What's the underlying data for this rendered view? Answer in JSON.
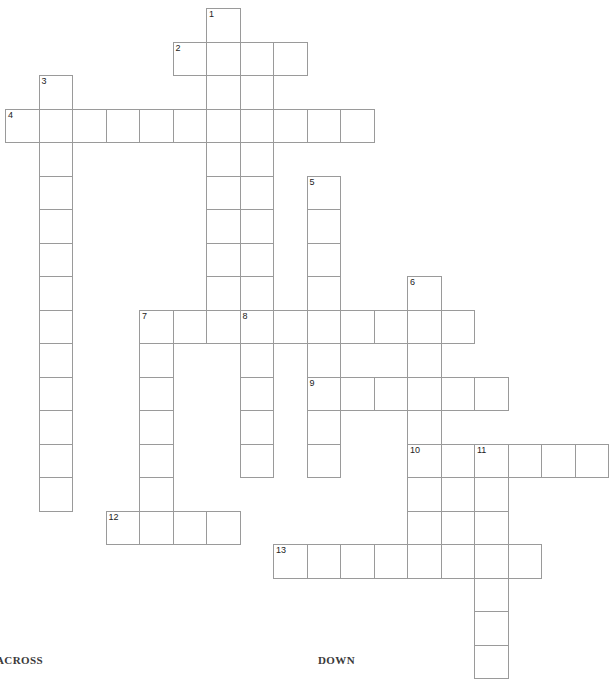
{
  "page": {
    "background_color": "#ffffff",
    "width": 607,
    "height": 666
  },
  "grid": {
    "cell_size": 33.5,
    "origin_x": 5,
    "origin_y": 8,
    "line_color": "#9a9a9a",
    "cell_fill": "#ffffff",
    "number_color": "#222222",
    "number_font_size": 9,
    "columns": 18,
    "rows": 20
  },
  "headings": {
    "across_label": "ACROSS",
    "down_label": "DOWN"
  },
  "entries": [
    {
      "number": "1",
      "direction": "down",
      "col": 6,
      "row": 0,
      "length": 12
    },
    {
      "number": "2",
      "direction": "across",
      "col": 5,
      "row": 1,
      "length": 4
    },
    {
      "number": "3",
      "direction": "down",
      "col": 1,
      "row": 2,
      "length": 13
    },
    {
      "number": "4",
      "direction": "across",
      "col": 0,
      "row": 3,
      "length": 11
    },
    {
      "number": "5",
      "direction": "down",
      "col": 9,
      "row": 5,
      "length": 10
    },
    {
      "number": "6",
      "direction": "down",
      "col": 12,
      "row": 8,
      "length": 8
    },
    {
      "number": "7",
      "direction": "across",
      "col": 4,
      "row": 9,
      "length": 10
    },
    {
      "number": "7",
      "direction": "down",
      "col": 4,
      "row": 9,
      "length": 7
    },
    {
      "number": "8",
      "direction": "down",
      "col": 7,
      "row": 9,
      "length": 6
    },
    {
      "number": "9",
      "direction": "across",
      "col": 9,
      "row": 11,
      "length": 6
    },
    {
      "number": "10",
      "direction": "across",
      "col": 12,
      "row": 13,
      "length": 6
    },
    {
      "number": "11",
      "direction": "down",
      "col": 14,
      "row": 13,
      "length": 7
    },
    {
      "number": "12",
      "direction": "across",
      "col": 3,
      "row": 15,
      "length": 4
    },
    {
      "number": "13",
      "direction": "across",
      "col": 8,
      "row": 16,
      "length": 8
    }
  ],
  "cells": [
    {
      "col": 6,
      "row": 0,
      "number": "1"
    },
    {
      "col": 5,
      "row": 1,
      "number": "2"
    },
    {
      "col": 6,
      "row": 1,
      "number": ""
    },
    {
      "col": 7,
      "row": 1,
      "number": ""
    },
    {
      "col": 8,
      "row": 1,
      "number": ""
    },
    {
      "col": 6,
      "row": 2,
      "number": ""
    },
    {
      "col": 7,
      "row": 2,
      "number": ""
    },
    {
      "col": 1,
      "row": 2,
      "number": "3"
    },
    {
      "col": 0,
      "row": 3,
      "number": "4"
    },
    {
      "col": 1,
      "row": 3,
      "number": ""
    },
    {
      "col": 2,
      "row": 3,
      "number": ""
    },
    {
      "col": 3,
      "row": 3,
      "number": ""
    },
    {
      "col": 4,
      "row": 3,
      "number": ""
    },
    {
      "col": 5,
      "row": 3,
      "number": ""
    },
    {
      "col": 6,
      "row": 3,
      "number": ""
    },
    {
      "col": 7,
      "row": 3,
      "number": ""
    },
    {
      "col": 8,
      "row": 3,
      "number": ""
    },
    {
      "col": 9,
      "row": 3,
      "number": ""
    },
    {
      "col": 10,
      "row": 3,
      "number": ""
    },
    {
      "col": 1,
      "row": 4,
      "number": ""
    },
    {
      "col": 6,
      "row": 4,
      "number": ""
    },
    {
      "col": 7,
      "row": 4,
      "number": ""
    },
    {
      "col": 1,
      "row": 5,
      "number": ""
    },
    {
      "col": 6,
      "row": 5,
      "number": ""
    },
    {
      "col": 7,
      "row": 5,
      "number": ""
    },
    {
      "col": 9,
      "row": 5,
      "number": "5"
    },
    {
      "col": 1,
      "row": 6,
      "number": ""
    },
    {
      "col": 6,
      "row": 6,
      "number": ""
    },
    {
      "col": 7,
      "row": 6,
      "number": ""
    },
    {
      "col": 9,
      "row": 6,
      "number": ""
    },
    {
      "col": 1,
      "row": 7,
      "number": ""
    },
    {
      "col": 6,
      "row": 7,
      "number": ""
    },
    {
      "col": 7,
      "row": 7,
      "number": ""
    },
    {
      "col": 9,
      "row": 7,
      "number": ""
    },
    {
      "col": 1,
      "row": 8,
      "number": ""
    },
    {
      "col": 6,
      "row": 8,
      "number": ""
    },
    {
      "col": 7,
      "row": 8,
      "number": ""
    },
    {
      "col": 9,
      "row": 8,
      "number": ""
    },
    {
      "col": 12,
      "row": 8,
      "number": "6"
    },
    {
      "col": 1,
      "row": 9,
      "number": ""
    },
    {
      "col": 4,
      "row": 9,
      "number": "7"
    },
    {
      "col": 5,
      "row": 9,
      "number": ""
    },
    {
      "col": 6,
      "row": 9,
      "number": ""
    },
    {
      "col": 7,
      "row": 9,
      "number": "8"
    },
    {
      "col": 8,
      "row": 9,
      "number": ""
    },
    {
      "col": 9,
      "row": 9,
      "number": ""
    },
    {
      "col": 10,
      "row": 9,
      "number": ""
    },
    {
      "col": 11,
      "row": 9,
      "number": ""
    },
    {
      "col": 12,
      "row": 9,
      "number": ""
    },
    {
      "col": 13,
      "row": 9,
      "number": ""
    },
    {
      "col": 1,
      "row": 10,
      "number": ""
    },
    {
      "col": 4,
      "row": 10,
      "number": ""
    },
    {
      "col": 7,
      "row": 10,
      "number": ""
    },
    {
      "col": 9,
      "row": 10,
      "number": ""
    },
    {
      "col": 12,
      "row": 10,
      "number": ""
    },
    {
      "col": 1,
      "row": 11,
      "number": ""
    },
    {
      "col": 4,
      "row": 11,
      "number": ""
    },
    {
      "col": 7,
      "row": 11,
      "number": ""
    },
    {
      "col": 9,
      "row": 11,
      "number": "9"
    },
    {
      "col": 10,
      "row": 11,
      "number": ""
    },
    {
      "col": 11,
      "row": 11,
      "number": ""
    },
    {
      "col": 12,
      "row": 11,
      "number": ""
    },
    {
      "col": 13,
      "row": 11,
      "number": ""
    },
    {
      "col": 14,
      "row": 11,
      "number": ""
    },
    {
      "col": 1,
      "row": 12,
      "number": ""
    },
    {
      "col": 4,
      "row": 12,
      "number": ""
    },
    {
      "col": 7,
      "row": 12,
      "number": ""
    },
    {
      "col": 9,
      "row": 12,
      "number": ""
    },
    {
      "col": 12,
      "row": 12,
      "number": ""
    },
    {
      "col": 1,
      "row": 13,
      "number": ""
    },
    {
      "col": 4,
      "row": 13,
      "number": ""
    },
    {
      "col": 7,
      "row": 13,
      "number": ""
    },
    {
      "col": 9,
      "row": 13,
      "number": ""
    },
    {
      "col": 12,
      "row": 13,
      "number": "10"
    },
    {
      "col": 13,
      "row": 13,
      "number": ""
    },
    {
      "col": 14,
      "row": 13,
      "number": "11"
    },
    {
      "col": 15,
      "row": 13,
      "number": ""
    },
    {
      "col": 16,
      "row": 13,
      "number": ""
    },
    {
      "col": 17,
      "row": 13,
      "number": ""
    },
    {
      "col": 1,
      "row": 14,
      "number": ""
    },
    {
      "col": 4,
      "row": 14,
      "number": ""
    },
    {
      "col": 12,
      "row": 14,
      "number": ""
    },
    {
      "col": 13,
      "row": 14,
      "number": ""
    },
    {
      "col": 14,
      "row": 14,
      "number": ""
    },
    {
      "col": 3,
      "row": 15,
      "number": "12"
    },
    {
      "col": 4,
      "row": 15,
      "number": ""
    },
    {
      "col": 5,
      "row": 15,
      "number": ""
    },
    {
      "col": 6,
      "row": 15,
      "number": ""
    },
    {
      "col": 12,
      "row": 15,
      "number": ""
    },
    {
      "col": 13,
      "row": 15,
      "number": ""
    },
    {
      "col": 14,
      "row": 15,
      "number": ""
    },
    {
      "col": 8,
      "row": 16,
      "number": "13"
    },
    {
      "col": 9,
      "row": 16,
      "number": ""
    },
    {
      "col": 10,
      "row": 16,
      "number": ""
    },
    {
      "col": 11,
      "row": 16,
      "number": ""
    },
    {
      "col": 12,
      "row": 16,
      "number": ""
    },
    {
      "col": 13,
      "row": 16,
      "number": ""
    },
    {
      "col": 14,
      "row": 16,
      "number": ""
    },
    {
      "col": 15,
      "row": 16,
      "number": ""
    },
    {
      "col": 14,
      "row": 17,
      "number": ""
    },
    {
      "col": 14,
      "row": 18,
      "number": ""
    },
    {
      "col": 14,
      "row": 19,
      "number": ""
    }
  ]
}
